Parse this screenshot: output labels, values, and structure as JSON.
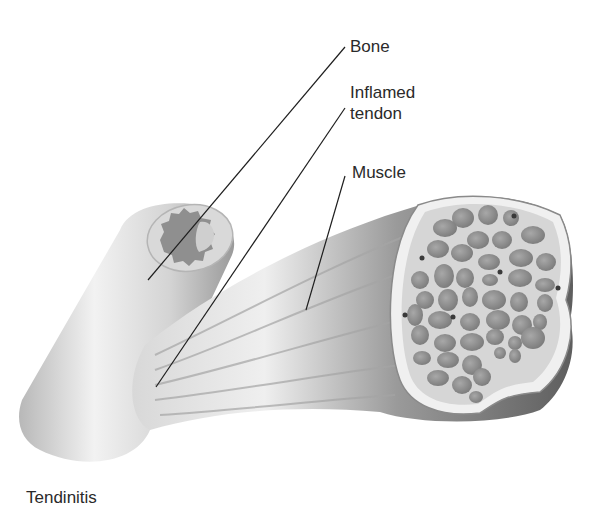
{
  "title": "Tendinitis",
  "labels": {
    "bone": "Bone",
    "inflamed_tendon_line1": "Inflamed",
    "inflamed_tendon_line2": "tendon",
    "muscle": "Muscle"
  },
  "colors": {
    "background": "#ffffff",
    "line": "#1e1e1e",
    "text": "#2a2a2a",
    "fiber": "#8c8c8c",
    "bone_light": "#e6e6e6",
    "muscle_dark": "#6e6e6e"
  }
}
